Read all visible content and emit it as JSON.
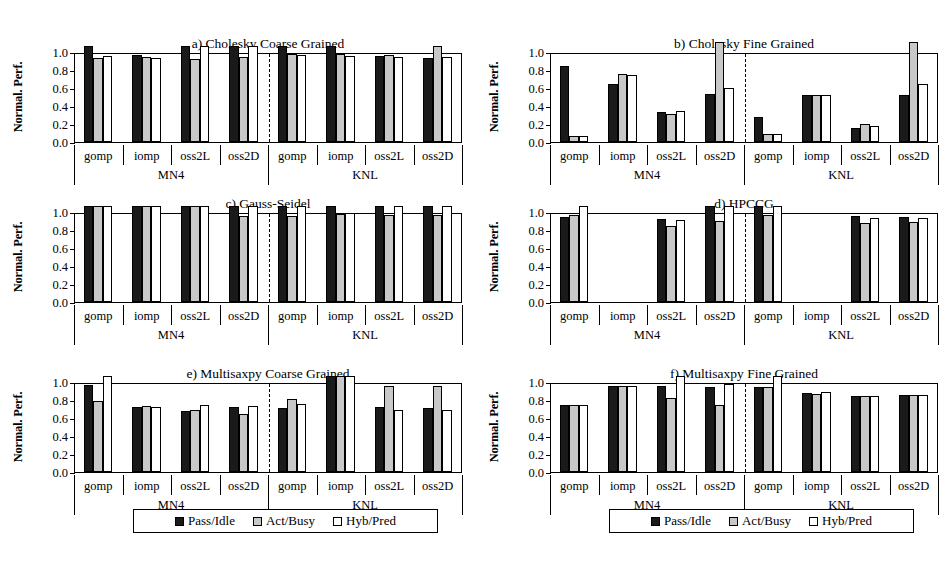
{
  "figure": {
    "width": 952,
    "height": 567,
    "ylabel": "Normal. Perf.",
    "ytick_labels": [
      "1.0",
      "0.8",
      "0.6",
      "0.4",
      "0.2",
      "0.0"
    ],
    "machines": [
      "MN4",
      "KNL"
    ],
    "configs": [
      "gomp",
      "iomp",
      "oss2L",
      "oss2D"
    ],
    "legend": [
      {
        "label": "Pass/Idle",
        "color": "#1a1a1a",
        "key": "pass"
      },
      {
        "label": "Act/Busy",
        "color": "#c8c8c8",
        "key": "act"
      },
      {
        "label": "Hyb/Pred",
        "color": "#ffffff",
        "key": "hyb"
      }
    ]
  },
  "chart_data": [
    {
      "id": "a",
      "type": "bar",
      "title": "a) Cholesky Coarse Grained",
      "xlabel": "",
      "ylabel": "Normal. Perf.",
      "ylim": [
        0.0,
        1.0
      ],
      "grid": false,
      "legend_position": "bottom",
      "categories": [
        "MN4 gomp",
        "MN4 iomp",
        "MN4 oss2L",
        "MN4 oss2D",
        "KNL gomp",
        "KNL iomp",
        "KNL oss2L",
        "KNL oss2D"
      ],
      "series": [
        {
          "name": "Pass/Idle",
          "values": [
            1.0,
            0.97,
            1.0,
            1.0,
            1.0,
            1.0,
            0.96,
            0.93
          ]
        },
        {
          "name": "Act/Busy",
          "values": [
            0.93,
            0.94,
            0.92,
            0.95,
            0.98,
            0.98,
            0.97,
            1.0
          ]
        },
        {
          "name": "Hyb/Pred",
          "values": [
            0.96,
            0.93,
            1.0,
            1.0,
            0.97,
            0.96,
            0.94,
            0.94
          ]
        }
      ]
    },
    {
      "id": "b",
      "type": "bar",
      "title": "b) Cholesky Fine Grained",
      "xlabel": "",
      "ylabel": "Normal. Perf.",
      "ylim": [
        0.0,
        1.0
      ],
      "grid": false,
      "legend_position": "bottom",
      "categories": [
        "MN4 gomp",
        "MN4 iomp",
        "MN4 oss2L",
        "MN4 oss2D",
        "KNL gomp",
        "KNL iomp",
        "KNL oss2L",
        "KNL oss2D"
      ],
      "series": [
        {
          "name": "Pass/Idle",
          "values": [
            0.84,
            0.64,
            0.33,
            0.53,
            0.28,
            0.52,
            0.16,
            0.52
          ]
        },
        {
          "name": "Act/Busy",
          "values": [
            0.07,
            0.76,
            0.31,
            1.05,
            0.09,
            0.52,
            0.2,
            1.05
          ]
        },
        {
          "name": "Hyb/Pred",
          "values": [
            0.07,
            0.75,
            0.34,
            0.6,
            0.09,
            0.52,
            0.18,
            0.65
          ]
        }
      ]
    },
    {
      "id": "c",
      "type": "bar",
      "title": "c) Gauss-Seidel",
      "xlabel": "",
      "ylabel": "Normal. Perf.",
      "ylim": [
        0.0,
        1.0
      ],
      "grid": false,
      "legend_position": "bottom",
      "categories": [
        "MN4 gomp",
        "MN4 iomp",
        "MN4 oss2L",
        "MN4 oss2D",
        "KNL gomp",
        "KNL iomp",
        "KNL oss2L",
        "KNL oss2D"
      ],
      "series": [
        {
          "name": "Pass/Idle",
          "values": [
            1.0,
            1.0,
            1.0,
            1.0,
            1.0,
            1.0,
            1.0,
            1.0
          ]
        },
        {
          "name": "Act/Busy",
          "values": [
            1.0,
            1.0,
            1.0,
            0.96,
            0.96,
            0.98,
            0.97,
            0.97
          ]
        },
        {
          "name": "Hyb/Pred",
          "values": [
            1.0,
            1.0,
            1.0,
            1.0,
            1.0,
            0.99,
            1.0,
            1.0
          ]
        }
      ]
    },
    {
      "id": "d",
      "type": "bar",
      "title": "d) HPCCG",
      "xlabel": "",
      "ylabel": "Normal. Perf.",
      "ylim": [
        0.0,
        1.0
      ],
      "grid": false,
      "legend_position": "bottom",
      "categories": [
        "MN4 gomp",
        "MN4 iomp",
        "MN4 oss2L",
        "MN4 oss2D",
        "KNL gomp",
        "KNL iomp",
        "KNL oss2L",
        "KNL oss2D"
      ],
      "series": [
        {
          "name": "Pass/Idle",
          "values": [
            0.95,
            0.0,
            0.92,
            1.0,
            1.0,
            0.0,
            0.96,
            0.95
          ]
        },
        {
          "name": "Act/Busy",
          "values": [
            0.97,
            0.0,
            0.84,
            0.9,
            0.97,
            0.0,
            0.88,
            0.89
          ]
        },
        {
          "name": "Hyb/Pred",
          "values": [
            1.0,
            0.0,
            0.91,
            1.0,
            1.0,
            0.0,
            0.93,
            0.93
          ]
        }
      ]
    },
    {
      "id": "e",
      "type": "bar",
      "title": "e) Multisaxpy Coarse Grained",
      "xlabel": "",
      "ylabel": "Normal. Perf.",
      "ylim": [
        0.0,
        1.0
      ],
      "grid": false,
      "legend_position": "bottom",
      "categories": [
        "MN4 gomp",
        "MN4 iomp",
        "MN4 oss2L",
        "MN4 oss2D",
        "KNL gomp",
        "KNL iomp",
        "KNL oss2L",
        "KNL oss2D"
      ],
      "series": [
        {
          "name": "Pass/Idle",
          "values": [
            0.97,
            0.72,
            0.68,
            0.72,
            0.71,
            1.0,
            0.72,
            0.71
          ]
        },
        {
          "name": "Act/Busy",
          "values": [
            0.79,
            0.73,
            0.69,
            0.65,
            0.81,
            1.0,
            0.96,
            0.96
          ]
        },
        {
          "name": "Hyb/Pred",
          "values": [
            1.0,
            0.72,
            0.74,
            0.73,
            0.76,
            1.0,
            0.69,
            0.69
          ]
        }
      ]
    },
    {
      "id": "f",
      "type": "bar",
      "title": "f) Multisaxpy Fine Grained",
      "xlabel": "",
      "ylabel": "Normal. Perf.",
      "ylim": [
        0.0,
        1.0
      ],
      "grid": false,
      "legend_position": "bottom",
      "categories": [
        "MN4 gomp",
        "MN4 iomp",
        "MN4 oss2L",
        "MN4 oss2D",
        "KNL gomp",
        "KNL iomp",
        "KNL oss2L",
        "KNL oss2D"
      ],
      "series": [
        {
          "name": "Pass/Idle",
          "values": [
            0.74,
            0.96,
            0.96,
            0.95,
            0.94,
            0.88,
            0.85,
            0.86
          ]
        },
        {
          "name": "Act/Busy",
          "values": [
            0.74,
            0.96,
            0.82,
            0.74,
            0.94,
            0.87,
            0.84,
            0.86
          ]
        },
        {
          "name": "Hyb/Pred",
          "values": [
            0.74,
            0.96,
            1.0,
            0.98,
            1.0,
            0.89,
            0.85,
            0.86
          ]
        }
      ]
    }
  ]
}
